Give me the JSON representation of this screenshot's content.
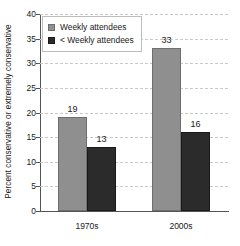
{
  "chart_data": {
    "type": "bar",
    "title": "",
    "xlabel": "",
    "ylabel": "Percent conservative or extremely conservative",
    "categories": [
      "1970s",
      "2000s"
    ],
    "series": [
      {
        "name": "Weekly attendees",
        "values": [
          19,
          33
        ],
        "color": "#8f8f8f"
      },
      {
        "name": "< Weekly attendees",
        "values": [
          13,
          16
        ],
        "color": "#2b2b2b"
      }
    ],
    "ylim": [
      0,
      40
    ],
    "yticks": [
      "0",
      "5",
      "10",
      "15",
      "20",
      "25",
      "30",
      "35",
      "40"
    ],
    "grid": true,
    "legend_position": "top-left",
    "data_labels": [
      "19",
      "13",
      "33",
      "16"
    ]
  },
  "legend": {
    "items": [
      {
        "label": "Weekly attendees"
      },
      {
        "label": "< Weekly attendees"
      }
    ]
  }
}
